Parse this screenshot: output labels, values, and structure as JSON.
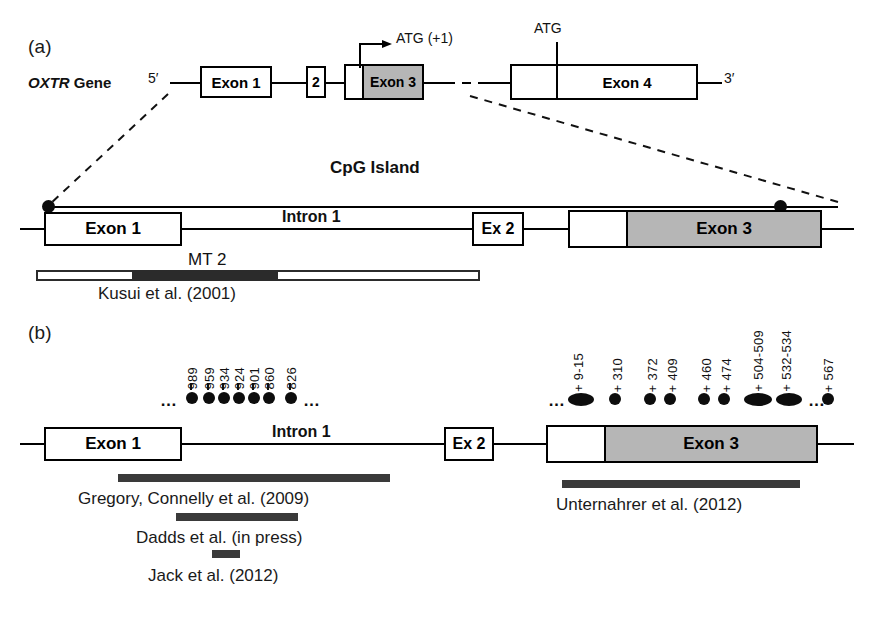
{
  "figure": {
    "panels": [
      {
        "id": "a",
        "label": "(a)"
      },
      {
        "id": "b",
        "label": "(b)"
      }
    ]
  },
  "panel_a": {
    "gene_label_italic": "OXTR",
    "gene_label_rest": " Gene",
    "five_prime": "5′",
    "three_prime": "3′",
    "atg_plus1": "ATG (+1)",
    "atg": "ATG",
    "exons": [
      {
        "name": "exon-1",
        "label": "Exon 1"
      },
      {
        "name": "exon-2",
        "label": "2"
      },
      {
        "name": "exon-3",
        "label": "Exon 3"
      },
      {
        "name": "exon-4",
        "label": "Exon 4"
      }
    ]
  },
  "panel_a_zoom": {
    "cpg_island_label": "CpG Island",
    "exon1_label": "Exon 1",
    "intron1_label": "Intron 1",
    "exon2_label": "Ex 2",
    "exon3_label": "Exon 3",
    "mt2_label": "MT 2",
    "kusui_citation": "Kusui et al. (2001)"
  },
  "panel_b": {
    "exon1_label": "Exon 1",
    "intron1_label": "Intron 1",
    "exon2_label": "Ex 2",
    "exon3_label": "Exon 3",
    "intron_cpg_sites": [
      {
        "label": "989"
      },
      {
        "label": "959"
      },
      {
        "label": "934"
      },
      {
        "label": "924"
      },
      {
        "label": "901"
      },
      {
        "label": "860"
      },
      {
        "label": "826"
      }
    ],
    "exon3_cpg_sites": [
      {
        "label": "+ 9-15"
      },
      {
        "label": "+ 310"
      },
      {
        "label": "+ 372"
      },
      {
        "label": "+ 409"
      },
      {
        "label": "+ 460"
      },
      {
        "label": "+ 474"
      },
      {
        "label": "+ 504-509"
      },
      {
        "label": "+ 532-534"
      },
      {
        "label": "+ 567"
      }
    ],
    "citations": [
      {
        "name": "gregory-connelly",
        "label": "Gregory, Connelly et al. (2009)"
      },
      {
        "name": "dadds",
        "label": "Dadds et al. (in press)"
      },
      {
        "name": "jack",
        "label": "Jack et al. (2012)"
      },
      {
        "name": "unternahrer",
        "label": "Unternahrer et al. (2012)"
      }
    ],
    "ellipsis": "…"
  },
  "colors": {
    "line": "#000000",
    "exon_shaded": "#b6b6b6",
    "bar_dark": "#2b2b2b",
    "dot": "#0d0d0d",
    "background": "#ffffff"
  }
}
